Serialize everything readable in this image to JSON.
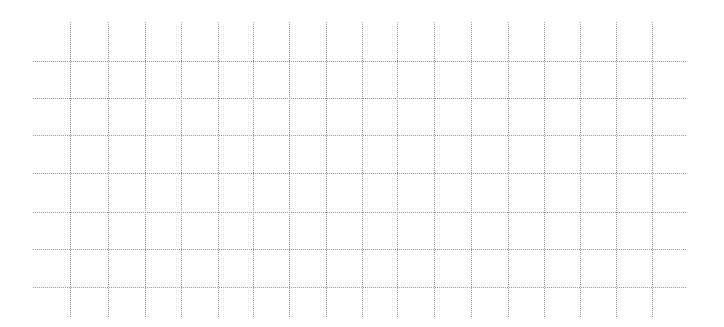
{
  "grid": {
    "line_color": "#9a9a9a",
    "line_style": "dotted",
    "vertical_lines_x": [
      70,
      108,
      145,
      181,
      218,
      253,
      289,
      326,
      362,
      397,
      434,
      471,
      508,
      544,
      580,
      616,
      652
    ],
    "vertical_span_y": [
      22,
      317
    ],
    "horizontal_lines_y": [
      61,
      98,
      135,
      173,
      212,
      249,
      287
    ],
    "horizontal_span_x": [
      33,
      686
    ]
  }
}
